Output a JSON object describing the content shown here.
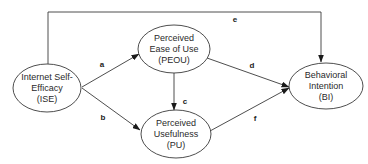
{
  "diagram": {
    "type": "path-model",
    "colors": {
      "stroke": "#3a3a3a",
      "text": "#2a2a2a",
      "background": "#ffffff"
    },
    "nodes": [
      {
        "id": "ISE",
        "lines": [
          "Internet Self-",
          "Efficacy",
          "(ISE)"
        ]
      },
      {
        "id": "PEOU",
        "lines": [
          "Perceived",
          "Ease of Use",
          "(PEOU)"
        ]
      },
      {
        "id": "PU",
        "lines": [
          "Perceived",
          "Usefulness",
          "(PU)"
        ]
      },
      {
        "id": "BI",
        "lines": [
          "Behavioral",
          "Intention",
          "(BI)"
        ]
      }
    ],
    "edges": [
      {
        "label": "a",
        "from": "ISE",
        "to": "PEOU"
      },
      {
        "label": "b",
        "from": "ISE",
        "to": "PU"
      },
      {
        "label": "c",
        "from": "PEOU",
        "to": "PU"
      },
      {
        "label": "d",
        "from": "PEOU",
        "to": "BI"
      },
      {
        "label": "e",
        "from": "ISE",
        "to": "BI"
      },
      {
        "label": "f",
        "from": "PU",
        "to": "BI"
      }
    ]
  }
}
